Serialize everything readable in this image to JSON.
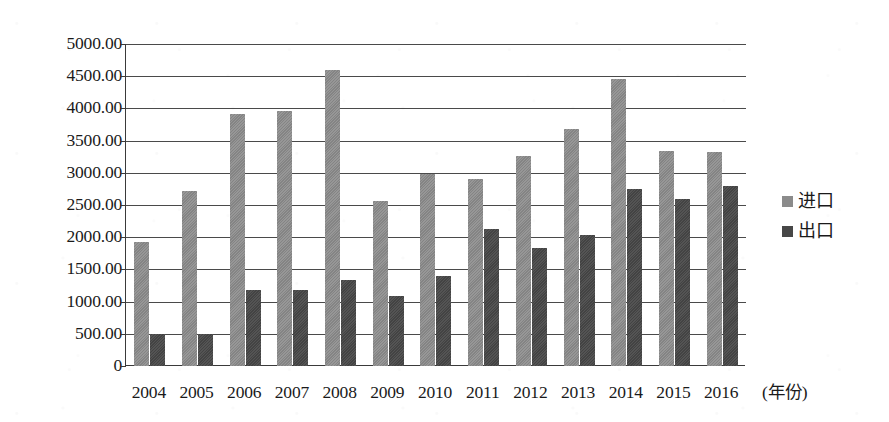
{
  "chart_data": {
    "type": "bar",
    "title": "",
    "subtitle": "",
    "xlabel": "(年份)",
    "ylabel": "",
    "categories": [
      "2004",
      "2005",
      "2006",
      "2007",
      "2008",
      "2009",
      "2010",
      "2011",
      "2012",
      "2013",
      "2014",
      "2015",
      "2016"
    ],
    "series": [
      {
        "name": "进口",
        "color": "#8b8b8b",
        "values": [
          1930,
          2710,
          3910,
          3960,
          4590,
          2570,
          2980,
          2910,
          3260,
          3680,
          4450,
          3340,
          3320
        ]
      },
      {
        "name": "出口",
        "color": "#474747",
        "values": [
          500,
          490,
          1180,
          1180,
          1340,
          1080,
          1400,
          2120,
          1840,
          2030,
          2750,
          2590,
          2790
        ]
      }
    ],
    "ylim": [
      0,
      5000
    ],
    "ytick_values": [
      5000,
      4500,
      4000,
      3500,
      3000,
      2500,
      2000,
      1500,
      1000,
      500,
      0
    ],
    "ytick_labels": [
      "5000.00",
      "4500.00",
      "4000.00",
      "3500.00",
      "3000.00",
      "2500.00",
      "2000.00",
      "1500.00",
      "1000.00",
      "500.00",
      "0"
    ],
    "grid": true,
    "grid_axis": "y",
    "legend_position": "right",
    "legend_entries": [
      "进口",
      "出口"
    ],
    "bar_mode": "grouped"
  },
  "figure": {
    "background_color": "#ffffff",
    "axis_color": "#3a3a3a",
    "gridline_color": "#4a4a4a",
    "text_color": "#1a1a1a"
  }
}
